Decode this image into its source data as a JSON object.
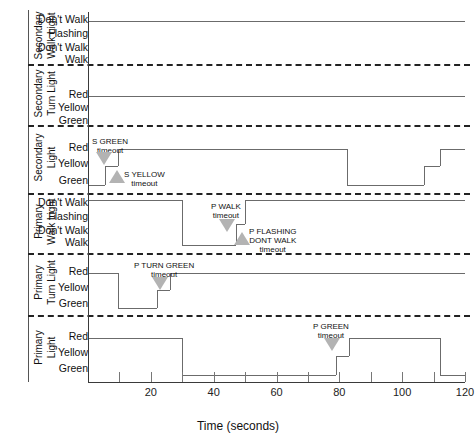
{
  "chart_data": {
    "type": "line",
    "title": "",
    "xlabel": "Time (seconds)",
    "ylabel": "",
    "xlim": [
      0,
      120
    ],
    "xticks": [
      0,
      10,
      20,
      30,
      40,
      50,
      60,
      70,
      80,
      90,
      100,
      110,
      120
    ],
    "xticklabels": [
      "",
      "",
      "20",
      "",
      "40",
      "",
      "60",
      "",
      "80",
      "",
      "100",
      "",
      "120"
    ],
    "grid": false,
    "legend": "none",
    "lanes": [
      {
        "name": "Secondary Walk Light",
        "states": [
          "Don't Walk",
          "Flashing Don't Walk",
          "Walk"
        ],
        "series": [
          {
            "t": 0,
            "state": "Don't Walk"
          },
          {
            "t": 120,
            "state": "Don't Walk"
          }
        ]
      },
      {
        "name": "Secondary Turn Light",
        "states": [
          "Red",
          "Yellow",
          "Green"
        ],
        "series": [
          {
            "t": 0,
            "state": "Red"
          },
          {
            "t": 120,
            "state": "Red"
          }
        ]
      },
      {
        "name": "Secondary Light",
        "states": [
          "Red",
          "Yellow",
          "Green"
        ],
        "series": [
          {
            "t": 0,
            "state": "Green"
          },
          {
            "t": 5.5,
            "state": "Yellow"
          },
          {
            "t": 9.5,
            "state": "Red"
          },
          {
            "t": 82.5,
            "state": "Green"
          },
          {
            "t": 107,
            "state": "Yellow"
          },
          {
            "t": 112,
            "state": "Red"
          },
          {
            "t": 120,
            "state": "Red"
          }
        ]
      },
      {
        "name": "Primary Walk Light",
        "states": [
          "Don't Walk",
          "Flashing Don't Walk",
          "Walk"
        ],
        "series": [
          {
            "t": 0,
            "state": "Don't Walk"
          },
          {
            "t": 30,
            "state": "Walk"
          },
          {
            "t": 47,
            "state": "Flashing Don't Walk"
          },
          {
            "t": 50,
            "state": "Don't Walk"
          },
          {
            "t": 120,
            "state": "Don't Walk"
          }
        ]
      },
      {
        "name": "Primary Turn Light",
        "states": [
          "Red",
          "Yellow",
          "Green"
        ],
        "series": [
          {
            "t": 0,
            "state": "Red"
          },
          {
            "t": 9.5,
            "state": "Green"
          },
          {
            "t": 22,
            "state": "Yellow"
          },
          {
            "t": 26,
            "state": "Red"
          },
          {
            "t": 120,
            "state": "Red"
          }
        ]
      },
      {
        "name": "Primary Light",
        "states": [
          "Red",
          "Yellow",
          "Green"
        ],
        "series": [
          {
            "t": 0,
            "state": "Red"
          },
          {
            "t": 30,
            "state": "Green"
          },
          {
            "t": 79,
            "state": "Yellow"
          },
          {
            "t": 83,
            "state": "Red"
          },
          {
            "t": 112,
            "state": "Green"
          },
          {
            "t": 120,
            "state": "Green"
          }
        ]
      }
    ],
    "annotations": [
      {
        "id": "s-green-timeout",
        "lines": [
          "S GREEN",
          "timeout"
        ],
        "t": 5.5,
        "marker": "triangle-down"
      },
      {
        "id": "s-yellow-timeout",
        "lines": [
          "S YELLOW",
          "timeout"
        ],
        "t": 9.5,
        "marker": "triangle-up"
      },
      {
        "id": "p-walk-timeout",
        "lines": [
          "P WALK",
          "timeout"
        ],
        "t": 47,
        "marker": "triangle-down"
      },
      {
        "id": "p-flashing-dont-walk-timeout",
        "lines": [
          "P FLASHING",
          "DONT WALK",
          "timeout"
        ],
        "t": 50,
        "marker": "triangle-up"
      },
      {
        "id": "p-turn-green-timeout",
        "lines": [
          "P TURN GREEN",
          "timeout"
        ],
        "t": 22,
        "marker": "triangle-down"
      },
      {
        "id": "p-green-timeout",
        "lines": [
          "P GREEN",
          "timeout"
        ],
        "t": 79,
        "marker": "triangle-down"
      }
    ]
  },
  "labels": {
    "secondary_walk_light": "Secondary Walk Light",
    "secondary_turn_light": "Secondary Turn Light",
    "secondary_light": "Secondary Light",
    "primary_walk_light": "Primary Walk Light",
    "primary_turn_light": "Primary Turn Light",
    "primary_light": "Primary Light",
    "dont_walk": "Don't Walk",
    "flashing": "Flashing",
    "dont_walk2": "Don't Walk",
    "walk": "Walk",
    "red": "Red",
    "yellow": "Yellow",
    "green": "Green",
    "x_axis_title": "Time (seconds)",
    "tick_20": "20",
    "tick_40": "40",
    "tick_60": "60",
    "tick_80": "80",
    "tick_100": "100",
    "tick_120": "120",
    "s_green": "S GREEN",
    "s_green_to": "timeout",
    "s_yellow": "S YELLOW",
    "s_yellow_to": "timeout",
    "p_walk": "P WALK",
    "p_walk_to": "timeout",
    "p_flashing": "P FLASHING",
    "p_flashing2": "DONT WALK",
    "p_flashing_to": "timeout",
    "p_turn_green": "P TURN GREEN",
    "p_turn_green_to": "timeout",
    "p_green": "P GREEN",
    "p_green_to": "timeout"
  }
}
